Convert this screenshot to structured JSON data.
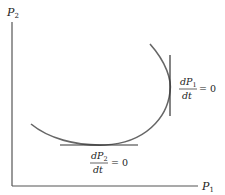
{
  "diagram": {
    "axes": {
      "x_label": "P",
      "x_label_sub": "1",
      "y_label": "P",
      "y_label_sub": "2"
    },
    "curve": {
      "description": "trajectory in P1-P2 phase plane"
    },
    "annotations": [
      {
        "id": "vertical-tangent",
        "numerator": "dP",
        "numerator_sub": "1",
        "denominator": "dt",
        "rhs": "= 0"
      },
      {
        "id": "horizontal-tangent",
        "numerator": "dP",
        "numerator_sub": "2",
        "denominator": "dt",
        "rhs": "= 0"
      }
    ],
    "colors": {
      "axis": "#555555",
      "curve": "#666666",
      "tangent": "#333333",
      "text": "#222222"
    }
  }
}
